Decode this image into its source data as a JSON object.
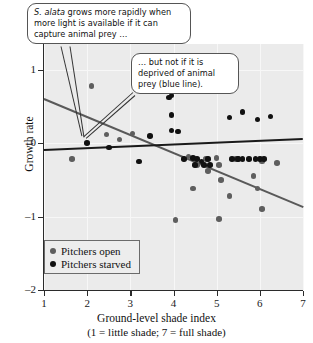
{
  "chart_data": {
    "type": "scatter",
    "title": "",
    "xlabel": "Ground-level shade index",
    "xlabel_sub": "(1 = little shade; 7 = full shade)",
    "ylabel": "Growth rate",
    "xlim": [
      1,
      7
    ],
    "ylim": [
      -2,
      1.35
    ],
    "xticks": [
      1,
      2,
      3,
      4,
      5,
      6,
      7
    ],
    "yticks": [
      1,
      0,
      -1,
      -2
    ],
    "grid": true,
    "legend_position": "lower-left",
    "series": [
      {
        "name": "Pitchers open",
        "color": "#5e5e5e",
        "marker": "circle",
        "points": [
          [
            2.1,
            0.78
          ],
          [
            1.65,
            -0.22
          ],
          [
            2.45,
            0.12
          ],
          [
            2.75,
            0.05
          ],
          [
            3.05,
            0.13
          ],
          [
            4.35,
            -0.18
          ],
          [
            4.55,
            -0.3
          ],
          [
            4.75,
            -0.22
          ],
          [
            4.8,
            -0.38
          ],
          [
            5.0,
            -0.2
          ],
          [
            5.05,
            -0.3
          ],
          [
            5.1,
            -0.5
          ],
          [
            5.3,
            -0.72
          ],
          [
            5.45,
            -0.22
          ],
          [
            5.5,
            -0.22
          ],
          [
            5.85,
            -0.45
          ],
          [
            5.95,
            -0.62
          ],
          [
            4.45,
            -0.62
          ],
          [
            4.05,
            -1.05
          ],
          [
            5.05,
            -1.03
          ],
          [
            6.05,
            -0.9
          ],
          [
            6.05,
            -0.25
          ],
          [
            6.4,
            -0.27
          ]
        ]
      },
      {
        "name": "Pitchers starved",
        "color": "#111111",
        "marker": "circle",
        "points": [
          [
            2.5,
            -0.06
          ],
          [
            3.9,
            0.62
          ],
          [
            3.95,
            0.65
          ],
          [
            3.95,
            0.38
          ],
          [
            3.95,
            0.17
          ],
          [
            4.1,
            0.16
          ],
          [
            3.45,
            0.1
          ],
          [
            3.2,
            -0.25
          ],
          [
            4.25,
            -0.22
          ],
          [
            4.45,
            -0.2
          ],
          [
            4.5,
            -0.3
          ],
          [
            4.55,
            -0.22
          ],
          [
            4.65,
            -0.25
          ],
          [
            4.7,
            -0.3
          ],
          [
            4.8,
            -0.22
          ],
          [
            4.85,
            -0.3
          ],
          [
            5.35,
            -0.22
          ],
          [
            5.5,
            -0.22
          ],
          [
            5.6,
            -0.22
          ],
          [
            5.75,
            -0.22
          ],
          [
            5.9,
            -0.22
          ],
          [
            6.0,
            -0.22
          ],
          [
            6.1,
            -0.22
          ],
          [
            5.3,
            0.35
          ],
          [
            5.6,
            0.42
          ],
          [
            5.95,
            0.32
          ],
          [
            6.25,
            0.36
          ],
          [
            2.0,
            0.0
          ]
        ]
      }
    ],
    "regression_lines": [
      {
        "name": "Pitchers open trend",
        "color": "#595959",
        "x0": 1.0,
        "y0": 0.62,
        "x1": 7.0,
        "y1": -0.85
      },
      {
        "name": "Pitchers starved trend",
        "color": "#1a1a1a",
        "x0": 1.0,
        "y0": -0.08,
        "x1": 7.0,
        "y1": 0.07
      }
    ],
    "annotations": [
      {
        "id": "callout-1",
        "text_italic": "S. alata",
        "text": " grows more rapidly when more light is available if it can capture animal prey …"
      },
      {
        "id": "callout-2",
        "text": "… but not if it is deprived of animal prey (blue line)."
      }
    ]
  },
  "legend": {
    "items": [
      {
        "label": "Pitchers open"
      },
      {
        "label": "Pitchers starved"
      }
    ]
  }
}
